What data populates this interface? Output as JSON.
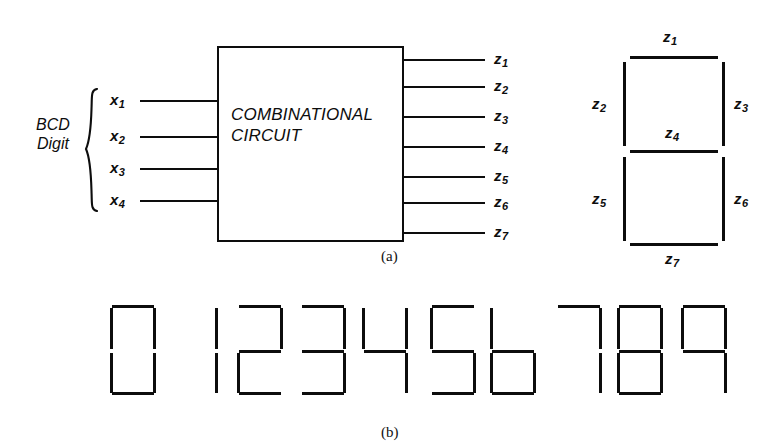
{
  "figure": {
    "part_a_caption": "(a)",
    "part_b_caption": "(b)"
  },
  "block": {
    "label": "COMBINATIONAL\nCIRCUIT"
  },
  "inputs": {
    "group_label": "BCD\nDigit",
    "signals": [
      {
        "base": "x",
        "sub": "1"
      },
      {
        "base": "x",
        "sub": "2"
      },
      {
        "base": "x",
        "sub": "3"
      },
      {
        "base": "x",
        "sub": "4"
      }
    ]
  },
  "outputs": {
    "signals": [
      {
        "base": "z",
        "sub": "1"
      },
      {
        "base": "z",
        "sub": "2"
      },
      {
        "base": "z",
        "sub": "3"
      },
      {
        "base": "z",
        "sub": "4"
      },
      {
        "base": "z",
        "sub": "5"
      },
      {
        "base": "z",
        "sub": "6"
      },
      {
        "base": "z",
        "sub": "7"
      }
    ]
  },
  "segment_template": {
    "labels": [
      {
        "base": "z",
        "sub": "1",
        "segment": "top"
      },
      {
        "base": "z",
        "sub": "2",
        "segment": "upper-left"
      },
      {
        "base": "z",
        "sub": "3",
        "segment": "upper-right"
      },
      {
        "base": "z",
        "sub": "4",
        "segment": "middle"
      },
      {
        "base": "z",
        "sub": "5",
        "segment": "lower-left"
      },
      {
        "base": "z",
        "sub": "6",
        "segment": "lower-right"
      },
      {
        "base": "z",
        "sub": "7",
        "segment": "bottom"
      }
    ]
  },
  "digits": [
    {
      "value": "0",
      "segments": {
        "a": true,
        "b": true,
        "c": true,
        "d": true,
        "e": true,
        "f": true,
        "g": false
      }
    },
    {
      "value": "1",
      "segments": {
        "a": false,
        "b": true,
        "c": true,
        "d": false,
        "e": false,
        "f": false,
        "g": false
      }
    },
    {
      "value": "2",
      "segments": {
        "a": true,
        "b": true,
        "c": false,
        "d": true,
        "e": true,
        "f": false,
        "g": true
      }
    },
    {
      "value": "3",
      "segments": {
        "a": true,
        "b": true,
        "c": true,
        "d": true,
        "e": false,
        "f": false,
        "g": true
      }
    },
    {
      "value": "4",
      "segments": {
        "a": false,
        "b": true,
        "c": true,
        "d": false,
        "e": false,
        "f": true,
        "g": true
      }
    },
    {
      "value": "5",
      "segments": {
        "a": true,
        "b": false,
        "c": true,
        "d": true,
        "e": false,
        "f": true,
        "g": true
      }
    },
    {
      "value": "6",
      "segments": {
        "a": false,
        "b": false,
        "c": true,
        "d": true,
        "e": true,
        "f": true,
        "g": true
      }
    },
    {
      "value": "7",
      "segments": {
        "a": true,
        "b": true,
        "c": true,
        "d": false,
        "e": false,
        "f": false,
        "g": false
      }
    },
    {
      "value": "8",
      "segments": {
        "a": true,
        "b": true,
        "c": true,
        "d": true,
        "e": true,
        "f": true,
        "g": true
      }
    },
    {
      "value": "9",
      "segments": {
        "a": true,
        "b": true,
        "c": true,
        "d": false,
        "e": false,
        "f": true,
        "g": true
      }
    }
  ],
  "colors": {
    "ink": "#0d0d0d",
    "paper": "#ffffff"
  }
}
